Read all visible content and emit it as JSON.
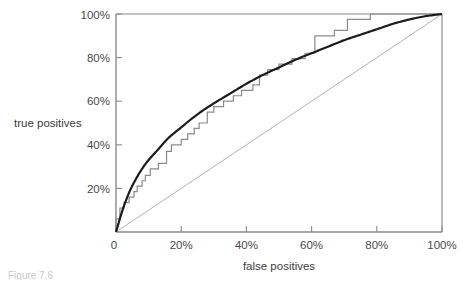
{
  "figure": {
    "caption_fragment": "Figure 7.6",
    "axis_titles": {
      "x": "false positives",
      "y": "true positives"
    }
  },
  "chart_data": {
    "type": "line",
    "title": "",
    "xlabel": "false positives",
    "ylabel": "true positives",
    "xlim": [
      0,
      100
    ],
    "ylim": [
      0,
      100
    ],
    "grid": false,
    "legend": null,
    "x_ticks": [
      0,
      20,
      40,
      60,
      80,
      100
    ],
    "x_tick_labels": [
      "0",
      "20%",
      "40%",
      "60%",
      "80%",
      "100%"
    ],
    "y_ticks": [
      0,
      20,
      40,
      60,
      80,
      100
    ],
    "y_tick_labels": [
      "0",
      "20%",
      "40%",
      "60%",
      "80%",
      "100%"
    ],
    "series": [
      {
        "name": "empirical ROC (step)",
        "style": "step",
        "color": "#8a8a8a",
        "width": 1.2,
        "points": [
          [
            0,
            0
          ],
          [
            0,
            6
          ],
          [
            1.2,
            6
          ],
          [
            1.2,
            11
          ],
          [
            2.5,
            11
          ],
          [
            2.5,
            13.5
          ],
          [
            4.0,
            13.5
          ],
          [
            4.0,
            16
          ],
          [
            5.5,
            16
          ],
          [
            5.5,
            18.5
          ],
          [
            6.5,
            18.5
          ],
          [
            6.5,
            21
          ],
          [
            8.0,
            21
          ],
          [
            8.0,
            23.5
          ],
          [
            9.0,
            23.5
          ],
          [
            9.0,
            26
          ],
          [
            10.5,
            26
          ],
          [
            10.5,
            29
          ],
          [
            13.0,
            29
          ],
          [
            13.0,
            31.5
          ],
          [
            15.5,
            31.5
          ],
          [
            15.5,
            37
          ],
          [
            17.0,
            37
          ],
          [
            17.0,
            40
          ],
          [
            20.0,
            40
          ],
          [
            20.0,
            42.5
          ],
          [
            22.0,
            42.5
          ],
          [
            22.0,
            45
          ],
          [
            24.0,
            45
          ],
          [
            24.0,
            47.5
          ],
          [
            25.5,
            47.5
          ],
          [
            25.5,
            50
          ],
          [
            28.0,
            50
          ],
          [
            28.0,
            55
          ],
          [
            30.0,
            55
          ],
          [
            30.0,
            57.5
          ],
          [
            33.0,
            57.5
          ],
          [
            33.0,
            60
          ],
          [
            36.0,
            60
          ],
          [
            36.0,
            62.5
          ],
          [
            38.5,
            62.5
          ],
          [
            38.5,
            65
          ],
          [
            42.0,
            65
          ],
          [
            42.0,
            67.5
          ],
          [
            44.0,
            67.5
          ],
          [
            44.0,
            72
          ],
          [
            46.5,
            72
          ],
          [
            46.5,
            74.5
          ],
          [
            50.0,
            74.5
          ],
          [
            50.0,
            77
          ],
          [
            54.0,
            77
          ],
          [
            54.0,
            79.5
          ],
          [
            58.0,
            79.5
          ],
          [
            58.0,
            82
          ],
          [
            61.0,
            82
          ],
          [
            61.0,
            90
          ],
          [
            67.0,
            90
          ],
          [
            67.0,
            92.5
          ],
          [
            71.0,
            92.5
          ],
          [
            71.0,
            97.5
          ],
          [
            78.0,
            97.5
          ],
          [
            78.0,
            100
          ],
          [
            100,
            100
          ]
        ]
      },
      {
        "name": "fitted ROC (smooth)",
        "style": "curve",
        "color": "#1c1c1c",
        "width": 2.2,
        "points": [
          [
            0,
            0
          ],
          [
            2,
            10
          ],
          [
            4,
            18
          ],
          [
            6,
            24
          ],
          [
            8,
            29
          ],
          [
            10,
            33
          ],
          [
            13,
            38
          ],
          [
            16,
            43
          ],
          [
            20,
            48
          ],
          [
            25,
            54
          ],
          [
            30,
            59
          ],
          [
            35,
            63.5
          ],
          [
            40,
            68
          ],
          [
            45,
            72
          ],
          [
            50,
            75.5
          ],
          [
            55,
            79
          ],
          [
            60,
            82
          ],
          [
            65,
            85
          ],
          [
            70,
            88
          ],
          [
            75,
            90.5
          ],
          [
            80,
            93
          ],
          [
            85,
            95.5
          ],
          [
            90,
            97.5
          ],
          [
            95,
            99
          ],
          [
            100,
            100
          ]
        ]
      },
      {
        "name": "chance diagonal",
        "style": "line",
        "color": "#9e9e9e",
        "width": 0.8,
        "points": [
          [
            0,
            0
          ],
          [
            100,
            100
          ]
        ]
      }
    ]
  }
}
